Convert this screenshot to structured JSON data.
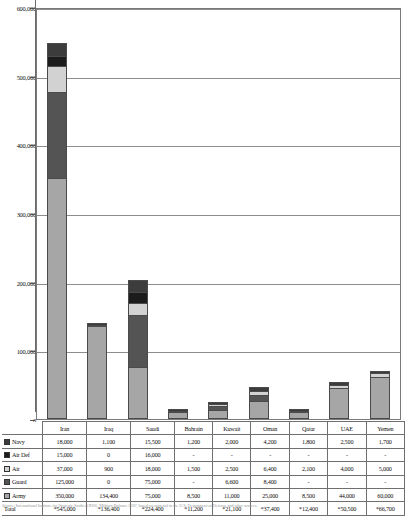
{
  "chart_data": {
    "type": "bar",
    "stacked": true,
    "title": "",
    "xlabel": "",
    "ylabel": "",
    "ylim": [
      0,
      600000
    ],
    "ytick_values": [
      0,
      100000,
      200000,
      300000,
      400000,
      500000,
      600000
    ],
    "ytick_labels": [
      "0",
      "100,000",
      "200,000",
      "300,000",
      "400,000",
      "500,000",
      "600,000"
    ],
    "grid": true,
    "legend_position": "table-row-headers",
    "categories": [
      "Iran",
      "Iraq",
      "Saudi",
      "Bahrain",
      "Kuwait",
      "Oman",
      "Qatar",
      "UAE",
      "Yemen"
    ],
    "series": [
      {
        "name": "Army",
        "color": "#a6a6a6",
        "values": [
          350000,
          134400,
          75000,
          8500,
          11000,
          25000,
          8500,
          44000,
          60000
        ],
        "display": [
          "350,000",
          "134,400",
          "75,000",
          "8,500",
          "11,000",
          "25,000",
          "8,500",
          "44,000",
          "60,000"
        ]
      },
      {
        "name": "Guard",
        "color": "#545454",
        "values": [
          125000,
          0,
          75000,
          null,
          6600,
          8400,
          null,
          null,
          null
        ],
        "display": [
          "125,000",
          "0",
          "75,000",
          "-",
          "6,600",
          "8,400",
          "-",
          "-",
          "-"
        ]
      },
      {
        "name": "Air",
        "color": "#d2d2d2",
        "values": [
          37000,
          900,
          18000,
          1500,
          2500,
          6400,
          2100,
          4000,
          5000
        ],
        "display": [
          "37,000",
          "900",
          "18,000",
          "1,500",
          "2,500",
          "6,400",
          "2,100",
          "4,000",
          "5,000"
        ]
      },
      {
        "name": "Air Def",
        "color": "#1c1c1c",
        "values": [
          15000,
          0,
          16000,
          null,
          null,
          null,
          null,
          null,
          null
        ],
        "display": [
          "15,000",
          "0",
          "16,000",
          "-",
          "-",
          "-",
          "-",
          "-",
          "-"
        ]
      },
      {
        "name": "Navy",
        "color": "#3c3c3c",
        "values": [
          18000,
          1100,
          15500,
          1200,
          2000,
          4200,
          1800,
          2500,
          1700
        ],
        "display": [
          "18,000",
          "1,100",
          "15,500",
          "1,200",
          "2,000",
          "4,200",
          "1,800",
          "2,500",
          "1,700"
        ]
      }
    ],
    "totals": {
      "label": "Total",
      "display": [
        "*545,000",
        "*136,400",
        "*224,400",
        "*11,200",
        "*21,100",
        "*37,400",
        "*12,400",
        "*50,500",
        "*66,700"
      ],
      "values": [
        545000,
        136400,
        224400,
        11200,
        21100,
        37400,
        12400,
        50500,
        66700
      ]
    }
  },
  "table": {
    "column_headers": [
      "",
      "Iran",
      "Iraq",
      "Saudi",
      "Bahrain",
      "Kuwait",
      "Oman",
      "Qatar",
      "UAE",
      "Yemen"
    ],
    "row_order": [
      "Navy",
      "Air Def",
      "Air",
      "Guard",
      "Army",
      "Total"
    ]
  },
  "footnote": {
    "text": "Source: International Institute for Strategic Studies (IISS), Military Balance 2007, based on material in the U.S. Department of Defense and other sources."
  },
  "axis": {
    "zero_label": "0"
  }
}
